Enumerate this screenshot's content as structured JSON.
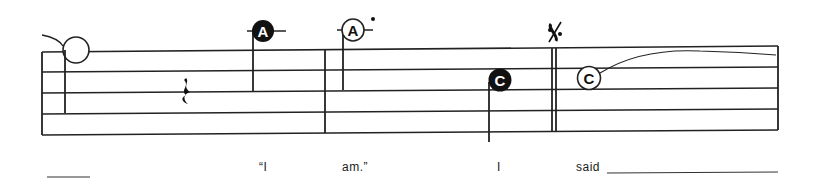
{
  "score": {
    "staff": {
      "lines": 5,
      "left_x": 42,
      "right_x": 778,
      "left_ys": [
        52,
        72,
        93,
        114,
        135
      ],
      "right_ys": [
        46,
        67,
        88,
        109,
        130
      ]
    },
    "barlines": [
      {
        "type": "single",
        "x": 325
      },
      {
        "type": "double",
        "x": 553
      }
    ],
    "segno": {
      "symbol": "𝄋",
      "x": 553
    },
    "notes": [
      {
        "id": "open-whole-note",
        "letter": "",
        "style": "open",
        "x": 76,
        "y": 50
      },
      {
        "id": "note-a-filled",
        "letter": "A",
        "style": "filled",
        "x": 263,
        "y": 33
      },
      {
        "id": "note-a-open",
        "letter": "A",
        "style": "open",
        "x": 352,
        "y": 31,
        "dot": true
      },
      {
        "id": "note-c-filled",
        "letter": "C",
        "style": "filled",
        "x": 500,
        "y": 80
      },
      {
        "id": "note-c-open",
        "letter": "C",
        "style": "open",
        "x": 589,
        "y": 78
      }
    ],
    "rest": {
      "type": "quarter-rest",
      "x": 186,
      "y": 93
    }
  },
  "lyrics": {
    "items": [
      {
        "text": "“I",
        "x": 259
      },
      {
        "text": "am.”",
        "x": 342
      },
      {
        "text": "I",
        "x": 497
      },
      {
        "text": "said",
        "x": 576
      }
    ],
    "lead_line": {
      "x1": 47,
      "x2": 90,
      "y": 177
    },
    "tail_line": {
      "x1": 607,
      "x2": 778,
      "y": 172
    }
  }
}
